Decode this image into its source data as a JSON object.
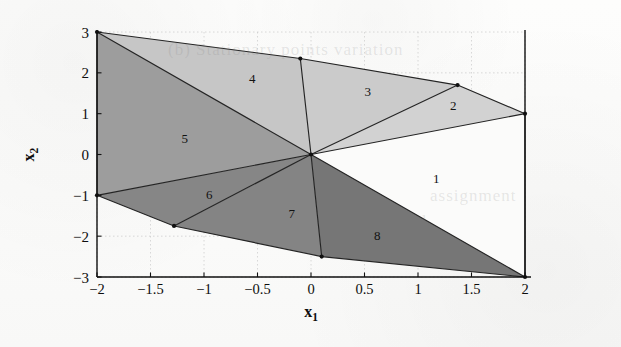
{
  "figure": {
    "kind": "polygonal-partition-plot",
    "background": "#fdfdfc",
    "frame_color": "#1a1a1a"
  },
  "axes": {
    "xlabel": "x_1",
    "xlabel_base": "x",
    "xlabel_sub": "1",
    "ylabel_base": "x",
    "ylabel_sub": "2",
    "xlim": [
      -2.25,
      2.25
    ],
    "ylim": [
      -3.3,
      3.3
    ],
    "xticks": [
      -2,
      -1.5,
      -1,
      -0.5,
      0,
      0.5,
      1,
      1.5,
      2
    ],
    "xticklabels": [
      "−2",
      "−1.5",
      "−1",
      "−0.5",
      "0",
      "0.5",
      "1",
      "1.5",
      "2"
    ],
    "yticks": [
      -3,
      -2,
      -1,
      0,
      1,
      2,
      3
    ],
    "yticklabels": [
      "−3",
      "−2",
      "−1",
      "0",
      "1",
      "2",
      "3"
    ],
    "grid": true,
    "grid_color": "#c9c9c9",
    "grid_style": "dotted"
  },
  "chart_data": {
    "type": "polygon-map",
    "title": "",
    "xlabel": "x_1",
    "ylabel": "x_2",
    "xlim": [
      -2.25,
      2.25
    ],
    "ylim": [
      -3.3,
      3.3
    ],
    "grid": true,
    "legend": "none",
    "hub_vertex": [
      0,
      0
    ],
    "vertices": [
      {
        "id": "A",
        "x": -2,
        "y": 3,
        "marked": true
      },
      {
        "id": "B",
        "x": -0.1,
        "y": 2.35,
        "marked": true
      },
      {
        "id": "C",
        "x": 1.37,
        "y": 1.7,
        "marked": true
      },
      {
        "id": "D",
        "x": 2,
        "y": 1,
        "marked": true
      },
      {
        "id": "E",
        "x": 2,
        "y": -3,
        "marked": true
      },
      {
        "id": "F",
        "x": 0.1,
        "y": -2.5,
        "marked": true
      },
      {
        "id": "G",
        "x": -1.28,
        "y": -1.75,
        "marked": true
      },
      {
        "id": "H",
        "x": -2,
        "y": -1,
        "marked": true
      },
      {
        "id": "O",
        "x": 0,
        "y": 0,
        "marked": true
      }
    ],
    "regions": [
      {
        "label": "1",
        "fill": "#fbfbfa",
        "label_xy": [
          1.17,
          -0.62
        ],
        "polygon": [
          [
            0,
            0
          ],
          [
            2,
            1
          ],
          [
            2,
            -3
          ]
        ]
      },
      {
        "label": "2",
        "fill": "#d2d2d2",
        "label_xy": [
          1.33,
          1.17
        ],
        "polygon": [
          [
            0,
            0
          ],
          [
            1.37,
            1.7
          ],
          [
            2,
            1
          ]
        ]
      },
      {
        "label": "3",
        "fill": "#cbcbcb",
        "label_xy": [
          0.53,
          1.5
        ],
        "polygon": [
          [
            0,
            0
          ],
          [
            -0.1,
            2.35
          ],
          [
            1.37,
            1.7
          ]
        ]
      },
      {
        "label": "4",
        "fill": "#c6c6c6",
        "label_xy": [
          -0.55,
          1.82
        ],
        "polygon": [
          [
            0,
            0
          ],
          [
            -2,
            3
          ],
          [
            -0.1,
            2.35
          ]
        ]
      },
      {
        "label": "5",
        "fill": "#9d9d9d",
        "label_xy": [
          -1.18,
          0.35
        ],
        "polygon": [
          [
            0,
            0
          ],
          [
            -2,
            3
          ],
          [
            -2,
            -1
          ]
        ]
      },
      {
        "label": "6",
        "fill": "#868686",
        "label_xy": [
          -0.95,
          -1.02
        ],
        "polygon": [
          [
            0,
            0
          ],
          [
            -2,
            -1
          ],
          [
            -1.28,
            -1.75
          ]
        ]
      },
      {
        "label": "7",
        "fill": "#848484",
        "label_xy": [
          -0.18,
          -1.47
        ],
        "polygon": [
          [
            0,
            0
          ],
          [
            -1.28,
            -1.75
          ],
          [
            0.1,
            -2.5
          ]
        ]
      },
      {
        "label": "8",
        "fill": "#767676",
        "label_xy": [
          0.62,
          -2.02
        ],
        "polygon": [
          [
            0,
            0
          ],
          [
            0.1,
            -2.5
          ],
          [
            2,
            -3
          ]
        ]
      }
    ],
    "edges": [
      [
        [
          -2,
          3
        ],
        [
          -0.1,
          2.35
        ]
      ],
      [
        [
          -0.1,
          2.35
        ],
        [
          1.37,
          1.7
        ]
      ],
      [
        [
          1.37,
          1.7
        ],
        [
          2,
          1
        ]
      ],
      [
        [
          2,
          1
        ],
        [
          2,
          -3
        ]
      ],
      [
        [
          2,
          -3
        ],
        [
          0.1,
          -2.5
        ]
      ],
      [
        [
          0.1,
          -2.5
        ],
        [
          -1.28,
          -1.75
        ]
      ],
      [
        [
          -1.28,
          -1.75
        ],
        [
          -2,
          -1
        ]
      ],
      [
        [
          -2,
          -1
        ],
        [
          -2,
          3
        ]
      ],
      [
        [
          0,
          0
        ],
        [
          -2,
          3
        ]
      ],
      [
        [
          0,
          0
        ],
        [
          -0.1,
          2.35
        ]
      ],
      [
        [
          0,
          0
        ],
        [
          1.37,
          1.7
        ]
      ],
      [
        [
          0,
          0
        ],
        [
          2,
          1
        ]
      ],
      [
        [
          0,
          0
        ],
        [
          2,
          -3
        ]
      ],
      [
        [
          0,
          0
        ],
        [
          0.1,
          -2.5
        ]
      ],
      [
        [
          0,
          0
        ],
        [
          -1.28,
          -1.75
        ]
      ],
      [
        [
          0,
          0
        ],
        [
          -2,
          -1
        ]
      ]
    ]
  },
  "scan_artifacts": [
    {
      "text": "(b) Stationary points variation",
      "x": 168,
      "y": 40
    },
    {
      "text": "assignment",
      "x": 430,
      "y": 186
    },
    {
      "text": "computed",
      "x": 352,
      "y": 212
    }
  ]
}
